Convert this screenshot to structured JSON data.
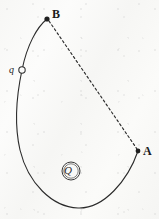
{
  "figure": {
    "background_color": "#fbfbfa",
    "ink_color": "#2b2b2b",
    "width": 159,
    "height": 219
  },
  "labels": {
    "point_b": "B",
    "point_a": "A",
    "moving_charge": "q",
    "source_charge": "Q"
  },
  "markers": {
    "point_b_dot": {
      "x": 47,
      "y": 19,
      "style": "filled-dot",
      "radius": 2.6
    },
    "point_a_dot": {
      "x": 138,
      "y": 151,
      "style": "filled-dot",
      "radius": 2.4
    },
    "charge_q_circle": {
      "x": 22,
      "y": 70,
      "style": "open-circle",
      "radius": 3.2
    }
  },
  "paths": {
    "curved_path": {
      "style": "solid",
      "stroke_width": 1.1,
      "description": "Curved trajectory from B down the left side, around the bottom, and up to A",
      "d": "M 47 19 C 37 27, 27 45, 22 70 C 16 98, 14 124, 20 150 C 28 183, 52 207, 78 208 C 104 209, 128 180, 138 151"
    },
    "dashed_chord": {
      "style": "dashed",
      "stroke_width": 1.1,
      "dash_array": "2.2 2.6",
      "description": "Straight dashed displacement line from B to A",
      "d": "M 49 21 L 137 149"
    }
  },
  "annotations": {
    "source_charge_symbol": "circled-Q",
    "source_charge_circle": {
      "cx": 71,
      "cy": 171,
      "r": 9
    }
  }
}
